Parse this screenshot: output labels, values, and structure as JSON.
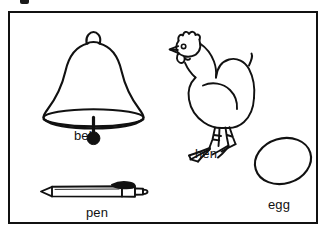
{
  "panel": {
    "kind": "picture-vocabulary-worksheet",
    "background_color": "#ffffff",
    "border_color": "#111111",
    "ink_color": "#111111",
    "artifact_present": true
  },
  "figures": [
    {
      "id": "bell",
      "icon_name": "bell-line-drawing",
      "label": "bell",
      "position": "top-left",
      "description": "outline drawing of a hand bell with loop handle, flared body, elliptical rim and round clapper"
    },
    {
      "id": "hen",
      "icon_name": "hen-line-drawing",
      "label": "hen",
      "position": "top-right",
      "description": "outline drawing of a standing hen facing left with comb, beak, wattle, upswept tail and two legs"
    },
    {
      "id": "pen",
      "icon_name": "pen-line-drawing",
      "label": "pen",
      "position": "bottom-left",
      "description": "outline drawing of a horizontal ballpoint pen with pointed tip at left, clip and push button at right"
    },
    {
      "id": "egg",
      "icon_name": "egg-line-drawing",
      "label": "egg",
      "position": "bottom-right",
      "description": "outline drawing of a tilted oval egg"
    }
  ]
}
